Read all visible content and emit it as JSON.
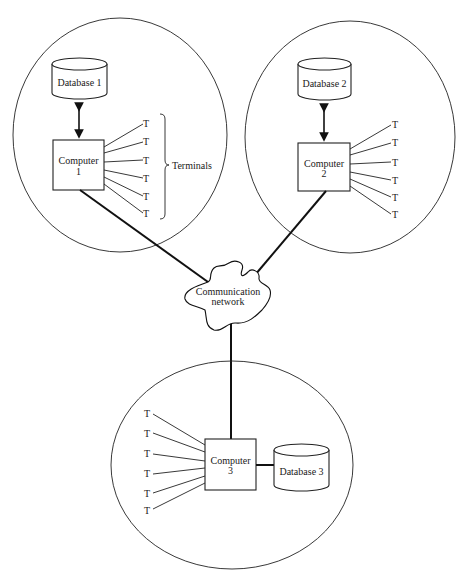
{
  "diagram": {
    "type": "distributed-database-network",
    "sites": [
      {
        "id": "site1",
        "computer": {
          "line1": "Computer",
          "line2": "1"
        },
        "database": {
          "label": "Database 1"
        },
        "terminals": [
          "T",
          "T",
          "T",
          "T",
          "T",
          "T"
        ],
        "terminals_label": "Terminals"
      },
      {
        "id": "site2",
        "computer": {
          "line1": "Computer",
          "line2": "2"
        },
        "database": {
          "label": "Database 2"
        },
        "terminals": [
          "T",
          "T",
          "T",
          "T",
          "T",
          "T"
        ]
      },
      {
        "id": "site3",
        "computer": {
          "line1": "Computer",
          "line2": "3"
        },
        "database": {
          "label": "Database 3"
        },
        "terminals": [
          "T",
          "T",
          "T",
          "T",
          "T",
          "T"
        ]
      }
    ],
    "network": {
      "line1": "Communication",
      "line2": "network"
    },
    "edges": [
      {
        "from": "Database 1",
        "to": "Computer 1",
        "kind": "bidirectional-arrow"
      },
      {
        "from": "Database 2",
        "to": "Computer 2",
        "kind": "bidirectional-arrow"
      },
      {
        "from": "Computer 3",
        "to": "Database 3",
        "kind": "thick-line"
      },
      {
        "from": "Computer 1",
        "to": "Communication network",
        "kind": "thick-line"
      },
      {
        "from": "Computer 2",
        "to": "Communication network",
        "kind": "thick-line"
      },
      {
        "from": "Computer 3",
        "to": "Communication network",
        "kind": "thick-line"
      }
    ],
    "colors": {
      "ink": "#1a1a1a",
      "background": "#ffffff"
    }
  }
}
